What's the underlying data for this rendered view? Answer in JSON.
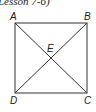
{
  "caption": "Lesson 7-6)",
  "diagram": {
    "type": "square with diagonals",
    "line_color": "#333333",
    "vertices": {
      "A": {
        "label": "A",
        "x": 15,
        "y": 23
      },
      "B": {
        "label": "B",
        "x": 87,
        "y": 23
      },
      "C": {
        "label": "C",
        "x": 87,
        "y": 93
      },
      "D": {
        "label": "D",
        "x": 15,
        "y": 93
      }
    },
    "intersection": {
      "label": "E",
      "x": 51,
      "y": 58
    },
    "segments": [
      "AB",
      "BC",
      "CD",
      "DA",
      "AC",
      "BD"
    ]
  }
}
